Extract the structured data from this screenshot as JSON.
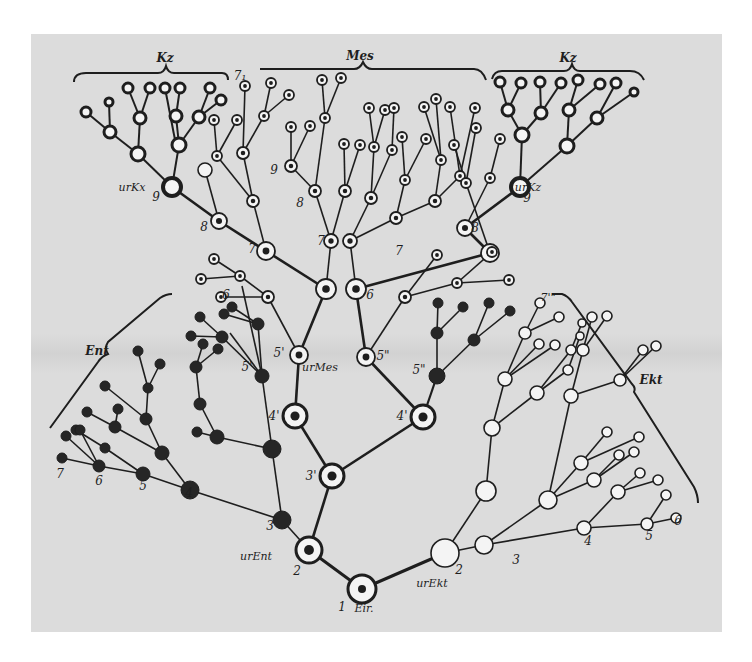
{
  "figure": {
    "colors": {
      "background": "#dcdcdc",
      "ink": "#1e1e1e",
      "page": "#ffffff"
    },
    "group_labels": [
      {
        "id": "kz-left",
        "text": "Kz",
        "x": 165,
        "y": 62
      },
      {
        "id": "mes",
        "text": "Mes",
        "x": 360,
        "y": 60
      },
      {
        "id": "kz-right",
        "text": "Kz",
        "x": 568,
        "y": 62
      },
      {
        "id": "ent",
        "text": "Ent",
        "x": 97,
        "y": 355
      },
      {
        "id": "ekt",
        "text": "Ekt",
        "x": 651,
        "y": 384
      }
    ],
    "node_labels": [
      {
        "text": "1",
        "x": 342,
        "y": 611
      },
      {
        "text": "Eir.",
        "x": 364,
        "y": 612
      },
      {
        "text": "2",
        "x": 297,
        "y": 575
      },
      {
        "text": "urEnt",
        "x": 256,
        "y": 560
      },
      {
        "text": "2",
        "x": 459,
        "y": 574
      },
      {
        "text": "urEkt",
        "x": 432,
        "y": 587
      },
      {
        "text": "3",
        "x": 270,
        "y": 530
      },
      {
        "text": "3",
        "x": 516,
        "y": 564
      },
      {
        "text": "3'",
        "x": 311,
        "y": 480
      },
      {
        "text": "4",
        "x": 189,
        "y": 497
      },
      {
        "text": "4'",
        "x": 274,
        "y": 420
      },
      {
        "text": "4'",
        "x": 402,
        "y": 420
      },
      {
        "text": "4",
        "x": 588,
        "y": 545
      },
      {
        "text": "5",
        "x": 143,
        "y": 490
      },
      {
        "text": "5'",
        "x": 247,
        "y": 371
      },
      {
        "text": "5'",
        "x": 279,
        "y": 357
      },
      {
        "text": "urMes",
        "x": 320,
        "y": 371
      },
      {
        "text": "5\"",
        "x": 383,
        "y": 360
      },
      {
        "text": "5\"",
        "x": 419,
        "y": 374
      },
      {
        "text": "5",
        "x": 649,
        "y": 540
      },
      {
        "text": "6",
        "x": 99,
        "y": 485
      },
      {
        "text": "6",
        "x": 226,
        "y": 299
      },
      {
        "text": "6",
        "x": 370,
        "y": 299
      },
      {
        "text": "6",
        "x": 678,
        "y": 525
      },
      {
        "text": "7",
        "x": 60,
        "y": 478
      },
      {
        "text": "7",
        "x": 252,
        "y": 253
      },
      {
        "text": "7",
        "x": 321,
        "y": 245
      },
      {
        "text": "7",
        "x": 399,
        "y": 255
      },
      {
        "text": "7'\"",
        "x": 548,
        "y": 301
      },
      {
        "text": "8",
        "x": 204,
        "y": 231
      },
      {
        "text": "8",
        "x": 300,
        "y": 207
      },
      {
        "text": "8",
        "x": 475,
        "y": 232
      },
      {
        "text": "9",
        "x": 156,
        "y": 201
      },
      {
        "text": "urKx",
        "x": 132,
        "y": 191
      },
      {
        "text": "9",
        "x": 274,
        "y": 174
      },
      {
        "text": "urKz",
        "x": 528,
        "y": 191
      },
      {
        "text": "9",
        "x": 527,
        "y": 202
      },
      {
        "text": "7₁",
        "x": 240,
        "y": 80
      }
    ]
  }
}
